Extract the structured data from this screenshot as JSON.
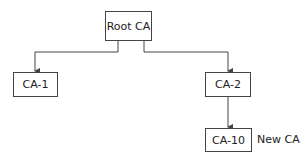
{
  "diagram": {
    "type": "tree",
    "title": "",
    "nodes": [
      {
        "id": "root",
        "label": "Root CA"
      },
      {
        "id": "ca1",
        "label": "CA-1"
      },
      {
        "id": "ca2",
        "label": "CA-2"
      },
      {
        "id": "ca10",
        "label": "CA-10"
      }
    ],
    "edges": [
      {
        "from": "root",
        "to": "ca1"
      },
      {
        "from": "root",
        "to": "ca2"
      },
      {
        "from": "ca2",
        "to": "ca10"
      }
    ],
    "annotations": [
      {
        "target": "ca10",
        "text": "New CA"
      }
    ],
    "colors": {
      "line": "#444444",
      "background": "#ffffff"
    }
  }
}
